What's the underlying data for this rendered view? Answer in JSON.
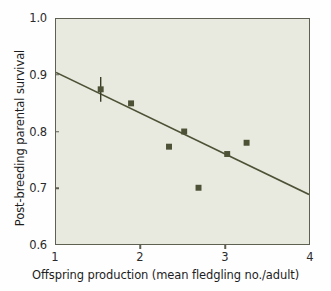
{
  "chart_data": {
    "type": "scatter",
    "title": "",
    "xlabel": "Offspring production (mean fledgling no./adult)",
    "ylabel": "Post-breeding parental survival",
    "xlim": [
      1,
      4
    ],
    "ylim": [
      0.6,
      1.0
    ],
    "xticks": [
      "1",
      "2",
      "3",
      "4"
    ],
    "xtick_values": [
      1,
      2,
      3,
      4
    ],
    "yticks": [
      "1.0",
      "0.9",
      "0.8",
      "0.7",
      "0.6"
    ],
    "ytick_values": [
      1.0,
      0.9,
      0.8,
      0.7,
      0.6
    ],
    "grid": false,
    "legend": "none",
    "series": [
      {
        "name": "Observed populations",
        "marker": "square",
        "color": "#4d5236",
        "points": [
          {
            "x": 1.53,
            "y": 0.875,
            "yerr": 0.022
          },
          {
            "x": 1.89,
            "y": 0.85
          },
          {
            "x": 2.34,
            "y": 0.773
          },
          {
            "x": 2.52,
            "y": 0.8
          },
          {
            "x": 2.69,
            "y": 0.7
          },
          {
            "x": 3.03,
            "y": 0.76
          },
          {
            "x": 3.26,
            "y": 0.78
          }
        ]
      }
    ],
    "trendline": {
      "name": "Linear regression fit",
      "color": "#4d5236",
      "x_start": 1.0,
      "y_start": 0.905,
      "x_end": 4.0,
      "y_end": 0.688
    },
    "plot_background_color": "#e9eadf",
    "axis_color": "#5f5f52"
  }
}
